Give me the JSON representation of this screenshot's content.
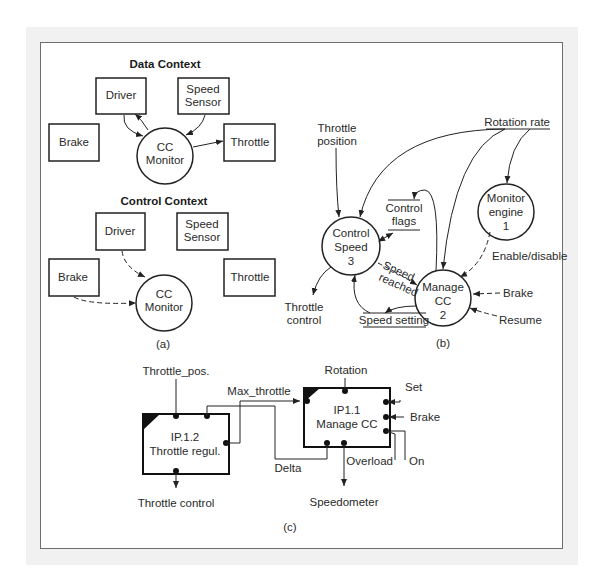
{
  "panel_a": {
    "data_context": {
      "title": "Data Context",
      "driver": "Driver",
      "speed_sensor": [
        "Speed",
        "Sensor"
      ],
      "brake": "Brake",
      "throttle": "Throttle",
      "monitor": [
        "CC",
        "Monitor"
      ]
    },
    "control_context": {
      "title": "Control Context",
      "driver": "Driver",
      "speed_sensor": [
        "Speed",
        "Sensor"
      ],
      "brake": "Brake",
      "throttle": "Throttle",
      "monitor": [
        "CC",
        "Monitor"
      ]
    },
    "caption": "(a)"
  },
  "panel_b": {
    "rotation_rate": "Rotation rate",
    "throttle_position": [
      "Throttle",
      "position"
    ],
    "control_speed": [
      "Control",
      "Speed",
      "3"
    ],
    "monitor_engine": [
      "Monitor",
      "engine",
      "1"
    ],
    "manage_cc": [
      "Manage",
      "CC",
      "2"
    ],
    "control_flags": [
      "Control",
      "flags"
    ],
    "speed_reached": [
      "Speed",
      "reached"
    ],
    "enable_disable": "Enable/disable",
    "brake": "Brake",
    "resume": "Resume",
    "speed_setting": "Speed setting",
    "throttle_control": [
      "Throttle",
      "control"
    ],
    "caption": "(b)"
  },
  "panel_c": {
    "throttle_pos": "Throttle_pos.",
    "max_throttle": "Max_throttle",
    "rotation": "Rotation",
    "ip12": [
      "IP.1.2",
      "Throttle regul."
    ],
    "ip11": [
      "IP1.1",
      "Manage CC"
    ],
    "delta": "Delta",
    "set": "Set",
    "brake": "Brake",
    "overload": "Overload",
    "on": "On",
    "throttle_control": "Throttle control",
    "speedometer": "Speedometer",
    "caption": "(c)"
  }
}
